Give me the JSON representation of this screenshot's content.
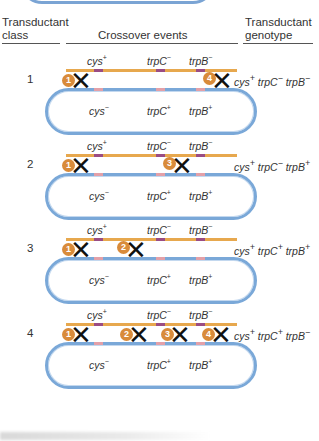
{
  "header": {
    "col1_line1": "Transductant",
    "col1_line2": "class",
    "col2": "Crossover events",
    "col3_line1": "Transductant",
    "col3_line2": "genotype"
  },
  "donor_labels": {
    "cys": "cys",
    "cys_sup": "+",
    "trpC": "trpC",
    "trpC_sup": "−",
    "trpB": "trpB",
    "trpB_sup": "−"
  },
  "recipient_labels": {
    "cys": "cys",
    "cys_sup": "−",
    "trpC": "trpC",
    "trpC_sup": "+",
    "trpB": "trpB",
    "trpB_sup": "+"
  },
  "colors": {
    "donor_strand": "#e7a84e",
    "recipient_chromosome": "#7aa8d8",
    "donor_marker": "#9a4c84",
    "recipient_marker": "#e3a0a8",
    "badge": "#d98b3a"
  },
  "rows": [
    {
      "class": "1",
      "crossovers": [
        "1",
        "4"
      ],
      "genotype": {
        "a": "cys",
        "a_sup": "+",
        "b": "trpC",
        "b_sup": "−",
        "c": "trpB",
        "c_sup": "−"
      }
    },
    {
      "class": "2",
      "crossovers": [
        "1",
        "3"
      ],
      "genotype": {
        "a": "cys",
        "a_sup": "+",
        "b": "trpC",
        "b_sup": "−",
        "c": "trpB",
        "c_sup": "+"
      }
    },
    {
      "class": "3",
      "crossovers": [
        "1",
        "2"
      ],
      "genotype": {
        "a": "cys",
        "a_sup": "+",
        "b": "trpC",
        "b_sup": "+",
        "c": "trpB",
        "c_sup": "+"
      }
    },
    {
      "class": "4",
      "crossovers": [
        "1",
        "2",
        "3",
        "4"
      ],
      "genotype": {
        "a": "cys",
        "a_sup": "+",
        "b": "trpC",
        "b_sup": "+",
        "c": "trpB",
        "c_sup": "−"
      }
    }
  ]
}
